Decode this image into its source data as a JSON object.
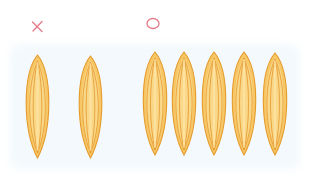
{
  "illustration": {
    "wrong_group": {
      "symbol": "×",
      "icon": "cross-mark-icon",
      "meaning": "incorrect",
      "grain_count": 2,
      "grains": [
        {
          "cx": 37,
          "top": 55,
          "bottom": 158,
          "width": 29
        },
        {
          "cx": 90,
          "top": 56,
          "bottom": 158,
          "width": 29
        }
      ]
    },
    "right_group": {
      "symbol": "○",
      "icon": "circle-mark-icon",
      "meaning": "correct",
      "grain_count": 5,
      "grains": [
        {
          "cx": 155,
          "top": 52,
          "bottom": 155,
          "width": 30
        },
        {
          "cx": 184,
          "top": 52,
          "bottom": 155,
          "width": 30
        },
        {
          "cx": 214,
          "top": 52,
          "bottom": 155,
          "width": 30
        },
        {
          "cx": 244,
          "top": 52,
          "bottom": 155,
          "width": 30
        },
        {
          "cx": 275,
          "top": 53,
          "bottom": 155,
          "width": 30
        }
      ]
    },
    "colors": {
      "mark": "#e87a8a",
      "grain_fill": "#f7c766",
      "grain_light": "#fde6a8",
      "grain_outline": "#e59a2a",
      "grain_vein": "#e39427",
      "background_tint": "#f3f9fc"
    }
  }
}
